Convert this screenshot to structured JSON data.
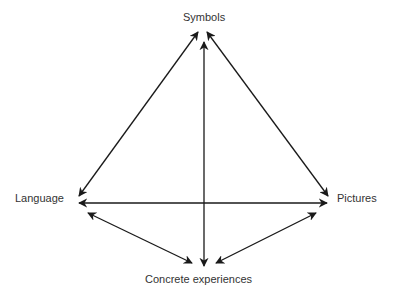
{
  "diagram": {
    "title": "",
    "nodes": [
      {
        "id": "symbols",
        "label": "Symbols"
      },
      {
        "id": "language",
        "label": "Language"
      },
      {
        "id": "pictures",
        "label": "Pictures"
      },
      {
        "id": "concrete",
        "label": "Concrete experiences"
      }
    ],
    "edges": [
      {
        "from": "symbols",
        "to": "language",
        "direction": "both"
      },
      {
        "from": "symbols",
        "to": "pictures",
        "direction": "both"
      },
      {
        "from": "symbols",
        "to": "concrete",
        "direction": "both"
      },
      {
        "from": "language",
        "to": "pictures",
        "direction": "both"
      },
      {
        "from": "language",
        "to": "concrete",
        "direction": "both"
      },
      {
        "from": "pictures",
        "to": "concrete",
        "direction": "both"
      }
    ],
    "colors": {
      "line": "#1a1a1a",
      "text": "#333333"
    }
  }
}
